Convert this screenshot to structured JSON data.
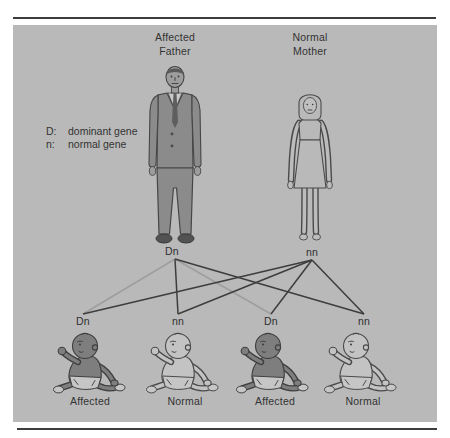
{
  "parents": {
    "father": {
      "label_line1": "Affected",
      "label_line2": "Father",
      "genotype": "Dn",
      "status": "Affected"
    },
    "mother": {
      "label_line1": "Normal",
      "label_line2": "Mother",
      "genotype": "nn",
      "status": "Normal"
    }
  },
  "legend": {
    "items": [
      {
        "symbol": "D:",
        "text": "dominant gene"
      },
      {
        "symbol": "n:",
        "text": "normal gene"
      }
    ]
  },
  "children": [
    {
      "genotype": "Dn",
      "status": "Affected"
    },
    {
      "genotype": "nn",
      "status": "Normal"
    },
    {
      "genotype": "Dn",
      "status": "Affected"
    },
    {
      "genotype": "nn",
      "status": "Normal"
    }
  ],
  "inheritance_lines": [
    {
      "from": "father",
      "to_child": 0,
      "gene": "D",
      "shade": "light"
    },
    {
      "from": "father",
      "to_child": 1,
      "gene": "n",
      "shade": "dark"
    },
    {
      "from": "father",
      "to_child": 2,
      "gene": "D",
      "shade": "light"
    },
    {
      "from": "father",
      "to_child": 3,
      "gene": "n",
      "shade": "dark"
    },
    {
      "from": "mother",
      "to_child": 0,
      "gene": "n",
      "shade": "dark"
    },
    {
      "from": "mother",
      "to_child": 1,
      "gene": "n",
      "shade": "dark"
    },
    {
      "from": "mother",
      "to_child": 2,
      "gene": "n",
      "shade": "dark"
    },
    {
      "from": "mother",
      "to_child": 3,
      "gene": "n",
      "shade": "dark"
    }
  ],
  "colors": {
    "panel_bg": "#b9b9b9",
    "border_rule": "#3d3d3d",
    "affected_fill": "#7e7e7e",
    "normal_fill": "#c3c3c3",
    "dominant_gene_line": "#9e9e9e",
    "normal_gene_line": "#3d3d3d",
    "text": "#333333"
  }
}
